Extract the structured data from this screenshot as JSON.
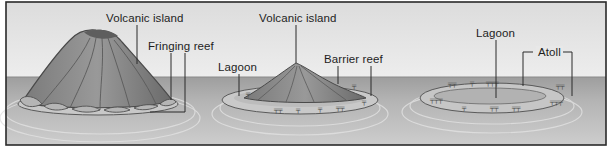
{
  "diagram": {
    "type": "illustration",
    "colors": {
      "frame": "#2a2a2a",
      "sky": "#e6e6e6",
      "sea": "#a9a9a9",
      "sea_light": "#cfcfcf",
      "island_dark": "#6c6c6c",
      "island_mid": "#8c8c8c",
      "island_light": "#a6a6a6",
      "reef": "#bdbdbd",
      "label_text": "#1e1e1e",
      "leader": "#2a2a2a"
    },
    "frame": {
      "x": 6,
      "y": 2,
      "width": 600,
      "height": 143
    },
    "horizon_y": 77,
    "panels": [
      {
        "name": "fringing-reef-stage",
        "labels": [
          {
            "id": "p1-volcanic-island",
            "text": "Volcanic island",
            "x": 106,
            "y": 12
          },
          {
            "id": "p1-fringing-reef",
            "text": "Fringing reef",
            "x": 148,
            "y": 40
          }
        ]
      },
      {
        "name": "barrier-reef-stage",
        "labels": [
          {
            "id": "p2-volcanic-island",
            "text": "Volcanic island",
            "x": 259,
            "y": 12
          },
          {
            "id": "p2-lagoon",
            "text": "Lagoon",
            "x": 218,
            "y": 61
          },
          {
            "id": "p2-barrier-reef",
            "text": "Barrier reef",
            "x": 324,
            "y": 53
          }
        ]
      },
      {
        "name": "atoll-stage",
        "labels": [
          {
            "id": "p3-lagoon",
            "text": "Lagoon",
            "x": 476,
            "y": 27
          },
          {
            "id": "p3-atoll",
            "text": "Atoll",
            "x": 536,
            "y": 46
          }
        ]
      }
    ]
  }
}
